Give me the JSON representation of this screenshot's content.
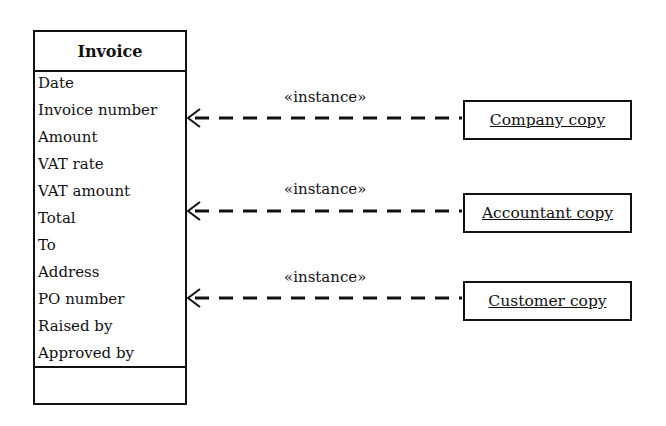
{
  "class": {
    "name": "Invoice",
    "attributes": [
      "Date",
      "Invoice number",
      "Amount",
      "VAT rate",
      "VAT amount",
      "Total",
      "To",
      "Address",
      "PO number",
      "Raised by",
      "Approved by"
    ],
    "operations": []
  },
  "instances": [
    {
      "name": "Company copy",
      "stereotype": "«instance»",
      "targets_attribute": "Invoice number"
    },
    {
      "name": "Accountant copy",
      "stereotype": "«instance»",
      "targets_attribute": "Total"
    },
    {
      "name": "Customer copy",
      "stereotype": "«instance»",
      "targets_attribute": "PO number"
    }
  ],
  "colors": {
    "line": "#111111",
    "background": "#ffffff"
  }
}
